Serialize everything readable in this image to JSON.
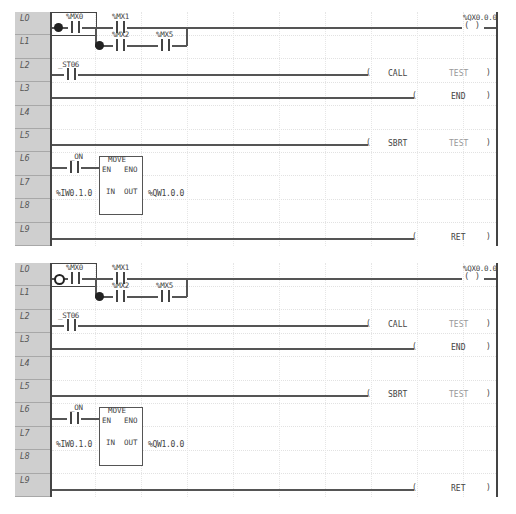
{
  "panels": [
    {
      "id": "top",
      "state": "rung-start-selected-filled",
      "row_labels": [
        "L0",
        "L1",
        "L2",
        "L3",
        "L4",
        "L5",
        "L6",
        "L7",
        "L8",
        "L9"
      ],
      "rung0": {
        "contacts": [
          "%MX0",
          "%MX1",
          "%MX2",
          "%MX5"
        ],
        "coil": "%QX0.0.0",
        "coil_symbol": "( )",
        "marker_mx0": "filled",
        "marker_mx2": "filled"
      },
      "rung2": {
        "contact": "_ST06",
        "instr": "CALL",
        "operand": "TEST"
      },
      "rung3": {
        "instr": "END"
      },
      "rung5": {
        "instr": "SBRT",
        "operand": "TEST"
      },
      "rung6": {
        "contact": "_ON",
        "block": {
          "name": "MOVE",
          "en": "EN",
          "eno": "ENO",
          "in": "IN",
          "out": "OUT"
        },
        "input": "%IW0.1.0",
        "output": "%QW1.0.0"
      },
      "rung9": {
        "instr": "RET"
      }
    },
    {
      "id": "bottom",
      "state": "rung-start-selected-hollow",
      "row_labels": [
        "L0",
        "L1",
        "L2",
        "L3",
        "L4",
        "L5",
        "L6",
        "L7",
        "L8",
        "L9"
      ],
      "rung0": {
        "contacts": [
          "%MX0",
          "%MX1",
          "%MX2",
          "%MX5"
        ],
        "coil": "%QX0.0.0",
        "coil_symbol": "( )",
        "marker_mx0": "hollow",
        "marker_mx2": "filled"
      },
      "rung2": {
        "contact": "_ST06",
        "instr": "CALL",
        "operand": "TEST"
      },
      "rung3": {
        "instr": "END"
      },
      "rung5": {
        "instr": "SBRT",
        "operand": "TEST"
      },
      "rung6": {
        "contact": "_ON",
        "block": {
          "name": "MOVE",
          "en": "EN",
          "eno": "ENO",
          "in": "IN",
          "out": "OUT"
        },
        "input": "%IW0.1.0",
        "output": "%QW1.0.0"
      },
      "rung9": {
        "instr": "RET"
      }
    }
  ],
  "colors": {
    "label_column": "#cfcfcf",
    "wire": "#555555",
    "rail": "#444444",
    "grid": "#e2e2e2"
  }
}
